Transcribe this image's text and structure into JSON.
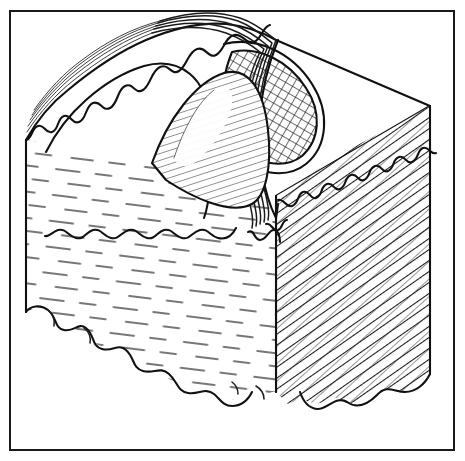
{
  "figure": {
    "title": "Block diagram of an eroded anticline fold",
    "domain_kind": "line-art geological block diagram",
    "frame": {
      "border_color": "#1a1a1a",
      "border_width_px": 2,
      "x": 9,
      "y": 10,
      "width": 446,
      "height": 441,
      "background_color": "#ffffff"
    },
    "ink_color": "#111111",
    "paper_color": "#ffffff",
    "labels": [],
    "annotations": [],
    "parts": [
      {
        "name": "top-surface",
        "description": "Upper erosional surface of the block, plan view of the fold",
        "fill": "#ffffff"
      },
      {
        "name": "front-left-face",
        "description": "Left cross-section face with sparse dashed horizontal bedding dashes (shale / mudstone ornament)",
        "pattern": "sparse-horizontal-dashes",
        "fill": "#ffffff"
      },
      {
        "name": "right-side-face",
        "description": "Right cross-section face with dense diagonal hatching (sandstone ornament)",
        "pattern": "dense-diagonal-hatch",
        "fill": "#ffffff"
      },
      {
        "name": "fold-crest-band",
        "description": "Scalloped / bumpy limestone marker band arching over the anticline crest",
        "pattern": "scalloped-bumps"
      },
      {
        "name": "fold-core",
        "description": "Inner hatched core of the anticline exposed at the crest",
        "pattern": "fine-parallel-hatch"
      },
      {
        "name": "crosshatch-lens",
        "description": "Cross-hatched lens-shaped unit on the right half of the top surface",
        "pattern": "cross-hatch-diamond"
      },
      {
        "name": "stratum-lines-left-limb",
        "description": "Five thin parallel strata lines on the left limb of the fold",
        "count": 5
      },
      {
        "name": "lobed-base",
        "description": "Cloud-like lobed lower boundary of the block (intrusive / weathered base)",
        "pattern": "lobed-bumps"
      }
    ]
  },
  "chart_data": {
    "type": "table",
    "title": "Block diagram of an eroded anticline fold",
    "categories": [
      "top-surface",
      "front-left-face",
      "right-side-face",
      "fold-crest-band",
      "fold-core",
      "crosshatch-lens",
      "lobed-base"
    ],
    "values": [
      1,
      1,
      1,
      1,
      1,
      1,
      1
    ],
    "xlabel": "",
    "ylabel": "",
    "grid": false,
    "legend": "none"
  }
}
